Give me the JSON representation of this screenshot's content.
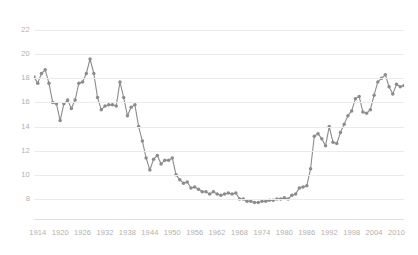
{
  "chart_data": {
    "type": "line",
    "title": "",
    "subtitle": "",
    "xlabel": "",
    "ylabel": "",
    "xlim": [
      1913,
      2012
    ],
    "ylim": [
      7,
      23
    ],
    "grid": true,
    "legend": false,
    "legend_position": "none",
    "marker": "circle",
    "line_color": "#8c8c8c",
    "marker_color": "#8c8c8c",
    "grid_color": "#eceaea",
    "tick_label_color": "#b3b0ae",
    "background_color": "#ffffff",
    "y_ticks": [
      8,
      10,
      12,
      14,
      16,
      18,
      20,
      22
    ],
    "x_ticks": [
      1914,
      1920,
      1926,
      1932,
      1938,
      1944,
      1950,
      1956,
      1962,
      1968,
      1974,
      1980,
      1986,
      1992,
      1998,
      2004,
      2010
    ],
    "x": [
      1913,
      1914,
      1915,
      1916,
      1917,
      1918,
      1919,
      1920,
      1921,
      1922,
      1923,
      1924,
      1925,
      1926,
      1927,
      1928,
      1929,
      1930,
      1931,
      1932,
      1933,
      1934,
      1935,
      1936,
      1937,
      1938,
      1939,
      1940,
      1941,
      1942,
      1943,
      1944,
      1945,
      1946,
      1947,
      1948,
      1949,
      1950,
      1951,
      1952,
      1953,
      1954,
      1955,
      1956,
      1957,
      1958,
      1959,
      1960,
      1961,
      1962,
      1963,
      1964,
      1965,
      1966,
      1967,
      1968,
      1969,
      1970,
      1971,
      1972,
      1973,
      1974,
      1975,
      1976,
      1977,
      1978,
      1979,
      1980,
      1981,
      1982,
      1983,
      1984,
      1985,
      1986,
      1987,
      1988,
      1989,
      1990,
      1991,
      1992,
      1993,
      1994,
      1995,
      1996,
      1997,
      1998,
      1999,
      2000,
      2001,
      2002,
      2003,
      2004,
      2005,
      2006,
      2007,
      2008,
      2009,
      2010,
      2011,
      2012
    ],
    "values": [
      18.1,
      17.6,
      18.4,
      18.7,
      17.6,
      16.0,
      15.9,
      14.5,
      15.9,
      16.2,
      15.5,
      16.2,
      17.6,
      17.7,
      18.4,
      19.6,
      18.4,
      16.4,
      15.4,
      15.7,
      15.8,
      15.8,
      15.7,
      17.7,
      16.4,
      14.9,
      15.6,
      15.8,
      14.0,
      12.8,
      11.4,
      10.4,
      11.3,
      11.6,
      10.9,
      11.2,
      11.2,
      11.4,
      10.0,
      9.6,
      9.3,
      9.4,
      8.9,
      9.0,
      8.8,
      8.6,
      8.6,
      8.4,
      8.6,
      8.4,
      8.3,
      8.4,
      8.5,
      8.4,
      8.5,
      8.0,
      8.0,
      7.8,
      7.8,
      7.7,
      7.7,
      7.8,
      7.8,
      7.9,
      7.9,
      8.0,
      8.0,
      8.1,
      8.0,
      8.3,
      8.4,
      8.9,
      9.0,
      9.1,
      10.5,
      13.2,
      13.4,
      13.0,
      12.4,
      14.0,
      12.7,
      12.6,
      13.5,
      14.2,
      14.9,
      15.3,
      16.3,
      16.5,
      15.2,
      15.1,
      15.4,
      16.6,
      17.7,
      18.0,
      18.3,
      17.3,
      16.7,
      17.5,
      17.3,
      17.4
    ]
  },
  "axes": {
    "y_axis_name": "y-axis",
    "x_axis_name": "x-axis"
  }
}
